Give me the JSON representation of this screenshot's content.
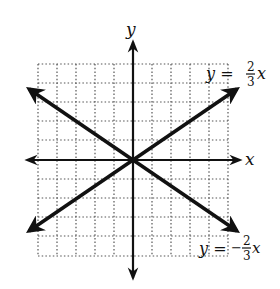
{
  "graph": {
    "title": "Graphs of y = (2/3)x and y = -(2/3)x",
    "axes": {
      "x_label": "x",
      "y_label": "y",
      "grid": true,
      "grid_style": "dotted",
      "x_range": [
        -5,
        5
      ],
      "y_range": [
        -5,
        5
      ],
      "tick_step": 1
    },
    "lines": [
      {
        "name": "positive-slope-line",
        "equation": "y = 2/3 x",
        "label_lhs": "y =",
        "label_num": "2",
        "label_den": "3",
        "label_var": "x",
        "slope": 0.6667,
        "intercept": 0
      },
      {
        "name": "negative-slope-line",
        "equation": "y = -2/3 x",
        "label_lhs": "y =",
        "label_sign": "−",
        "label_num": "2",
        "label_den": "3",
        "label_var": "x",
        "slope": -0.6667,
        "intercept": 0
      }
    ],
    "colors": {
      "line": "#111111",
      "grid": "#555555",
      "background": "#ffffff"
    }
  }
}
